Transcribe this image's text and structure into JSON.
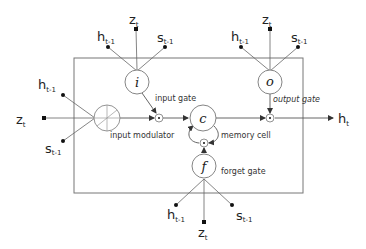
{
  "diagram": {
    "type": "lstm-cell",
    "colors": {
      "line": "#555555",
      "node_fill": "#ffffff",
      "text": "#222222"
    },
    "nodes": {
      "input_gate": {
        "symbol": "i",
        "label": "input gate"
      },
      "output_gate": {
        "symbol": "o",
        "label": "output gate"
      },
      "forget_gate": {
        "symbol": "f",
        "label": "forget gate"
      },
      "memory_cell": {
        "symbol": "c",
        "label": "memory cell"
      },
      "input_modulator": {
        "symbol": "circled-cross",
        "label": "input modulator"
      },
      "multiply_symbol": "⊙"
    },
    "inputs": {
      "h": {
        "base": "h",
        "sub": "t-1"
      },
      "z": {
        "base": "z",
        "sub": "t"
      },
      "s": {
        "base": "s",
        "sub": "t-1"
      }
    },
    "output": {
      "base": "h",
      "sub": "t"
    }
  }
}
